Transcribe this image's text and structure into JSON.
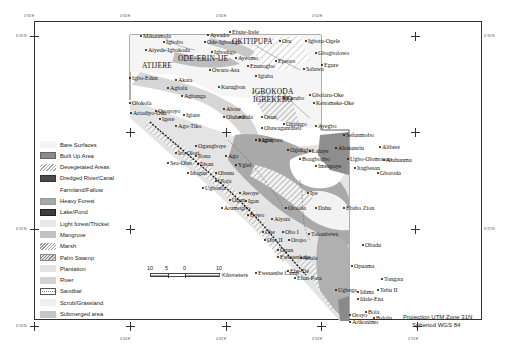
{
  "map": {
    "top_ticks": [
      {
        "x": 34,
        "label": "4°35'E"
      },
      {
        "x": 130,
        "label": "4°40'E"
      },
      {
        "x": 226,
        "label": "4°45'E"
      },
      {
        "x": 321,
        "label": "4°50'E"
      }
    ],
    "bottom_ticks": [
      {
        "x": 130,
        "label": "4°40'E"
      },
      {
        "x": 226,
        "label": "4°45'E"
      },
      {
        "x": 321,
        "label": "4°50'E"
      },
      {
        "x": 417,
        "label": "4°55'E"
      }
    ],
    "left_ticks": [
      {
        "y": 36,
        "label": "6°35'N"
      },
      {
        "y": 229,
        "label": "6°25'N"
      },
      {
        "y": 326,
        "label": "6°20'N"
      }
    ],
    "right_ticks": [
      {
        "y": 36,
        "label": "6°35'N"
      },
      {
        "y": 229,
        "label": "6°25'N"
      }
    ],
    "places": [
      {
        "name": "Mikunmola",
        "x": 143,
        "y": 33
      },
      {
        "name": "Igbobo",
        "x": 166,
        "y": 39
      },
      {
        "name": "Aiyede-Igbokoda",
        "x": 148,
        "y": 47
      },
      {
        "name": "Ayeadre",
        "x": 210,
        "y": 32
      },
      {
        "name": "Ebute-Irele",
        "x": 232,
        "y": 29
      },
      {
        "name": "Ode-Igbodigo",
        "x": 207,
        "y": 39
      },
      {
        "name": "OKITIPUPA",
        "x": 232,
        "y": 38,
        "big": true
      },
      {
        "name": "Oru",
        "x": 282,
        "y": 38
      },
      {
        "name": "Igbodigo",
        "x": 214,
        "y": 49
      },
      {
        "name": "Ayeomo",
        "x": 238,
        "y": 55
      },
      {
        "name": "Igbotu-Ogele",
        "x": 308,
        "y": 38
      },
      {
        "name": "Gbogbolowo",
        "x": 318,
        "y": 50
      },
      {
        "name": "Epeoro",
        "x": 278,
        "y": 58
      },
      {
        "name": "Egure",
        "x": 324,
        "y": 62
      },
      {
        "name": "Enunogbo",
        "x": 250,
        "y": 63
      },
      {
        "name": "Saluwa",
        "x": 306,
        "y": 66
      },
      {
        "name": "ATIJERE",
        "x": 142,
        "y": 62,
        "big": true
      },
      {
        "name": "ODE-ERIN-IJE",
        "x": 178,
        "y": 55,
        "big": true
      },
      {
        "name": "Igbo-Edun",
        "x": 132,
        "y": 75
      },
      {
        "name": "Akata",
        "x": 178,
        "y": 77
      },
      {
        "name": "Owara-Asa",
        "x": 212,
        "y": 67
      },
      {
        "name": "Igiaba",
        "x": 258,
        "y": 73
      },
      {
        "name": "Agbala",
        "x": 170,
        "y": 85
      },
      {
        "name": "Kurugbon",
        "x": 221,
        "y": 84
      },
      {
        "name": "IGBOKODA",
        "x": 252,
        "y": 88,
        "big": true
      },
      {
        "name": "IGBEKEBO",
        "x": 253,
        "y": 96,
        "big": true
      },
      {
        "name": "Agbanga",
        "x": 184,
        "y": 93
      },
      {
        "name": "Gbolaru-Oke",
        "x": 312,
        "y": 92
      },
      {
        "name": "Kurubo",
        "x": 286,
        "y": 95
      },
      {
        "name": "Kenomeke-Oke",
        "x": 316,
        "y": 100
      },
      {
        "name": "Olokola",
        "x": 132,
        "y": 100
      },
      {
        "name": "Abote",
        "x": 226,
        "y": 106
      },
      {
        "name": "Ariadiyo-Oda",
        "x": 133,
        "y": 110
      },
      {
        "name": "Opopoyo",
        "x": 158,
        "y": 108
      },
      {
        "name": "Igiare",
        "x": 186,
        "y": 112
      },
      {
        "name": "Osun",
        "x": 264,
        "y": 114
      },
      {
        "name": "Ilula",
        "x": 242,
        "y": 114
      },
      {
        "name": "Oluhere",
        "x": 226,
        "y": 114
      },
      {
        "name": "Ogiango",
        "x": 286,
        "y": 121
      },
      {
        "name": "Ayegbo",
        "x": 318,
        "y": 123
      },
      {
        "name": "Oluwaguntafeli",
        "x": 264,
        "y": 125
      },
      {
        "name": "Igere",
        "x": 162,
        "y": 116
      },
      {
        "name": "Ago-Tiko",
        "x": 178,
        "y": 123
      },
      {
        "name": "Igbiyoro",
        "x": 262,
        "y": 137
      },
      {
        "name": "Lagos",
        "x": 258,
        "y": 137
      },
      {
        "name": "Sefunmobo",
        "x": 346,
        "y": 132
      },
      {
        "name": "Abokunrin",
        "x": 338,
        "y": 145
      },
      {
        "name": "Alibere",
        "x": 382,
        "y": 144
      },
      {
        "name": "Ugbo-Olomotoro",
        "x": 350,
        "y": 156
      },
      {
        "name": "Aiuhunmu",
        "x": 386,
        "y": 157
      },
      {
        "name": "Itagbesan",
        "x": 357,
        "y": 165
      },
      {
        "name": "Gboroda",
        "x": 380,
        "y": 170
      },
      {
        "name": "Ogungboye",
        "x": 198,
        "y": 143
      },
      {
        "name": "Ito-Olori",
        "x": 178,
        "y": 150
      },
      {
        "name": "Ilona",
        "x": 198,
        "y": 153
      },
      {
        "name": "Ago",
        "x": 228,
        "y": 153
      },
      {
        "name": "Ogidigbo",
        "x": 290,
        "y": 147
      },
      {
        "name": "Lalaye",
        "x": 312,
        "y": 148
      },
      {
        "name": "Boagbogbo",
        "x": 302,
        "y": 156
      },
      {
        "name": "Imeapaye",
        "x": 318,
        "y": 163
      },
      {
        "name": "Sea-Olee",
        "x": 170,
        "y": 160
      },
      {
        "name": "Ilisan",
        "x": 200,
        "y": 161
      },
      {
        "name": "Yglei",
        "x": 238,
        "y": 162
      },
      {
        "name": "Idogun",
        "x": 190,
        "y": 170
      },
      {
        "name": "Obenu",
        "x": 218,
        "y": 170
      },
      {
        "name": "Ugbonla",
        "x": 205,
        "y": 185
      },
      {
        "name": "Oloja",
        "x": 218,
        "y": 178
      },
      {
        "name": "Awoye",
        "x": 242,
        "y": 190
      },
      {
        "name": "Ipe",
        "x": 310,
        "y": 190
      },
      {
        "name": "Ogun",
        "x": 232,
        "y": 197
      },
      {
        "name": "Arumogbo",
        "x": 224,
        "y": 205
      },
      {
        "name": "Igan",
        "x": 248,
        "y": 198
      },
      {
        "name": "Orooba",
        "x": 288,
        "y": 205
      },
      {
        "name": "Dahu",
        "x": 318,
        "y": 205
      },
      {
        "name": "Ebabo Zion",
        "x": 346,
        "y": 205
      },
      {
        "name": "Bowo",
        "x": 250,
        "y": 212
      },
      {
        "name": "Aiyata",
        "x": 274,
        "y": 216
      },
      {
        "name": "Obe",
        "x": 265,
        "y": 229
      },
      {
        "name": "Obo I",
        "x": 285,
        "y": 229
      },
      {
        "name": "Takanbewa",
        "x": 311,
        "y": 231
      },
      {
        "name": "Obo II",
        "x": 267,
        "y": 237
      },
      {
        "name": "Oropo",
        "x": 291,
        "y": 237
      },
      {
        "name": "Obadu",
        "x": 365,
        "y": 242
      },
      {
        "name": "Ogun",
        "x": 280,
        "y": 247
      },
      {
        "name": "Eweuenbeke",
        "x": 280,
        "y": 254
      },
      {
        "name": "Abule",
        "x": 303,
        "y": 255
      },
      {
        "name": "Opuama",
        "x": 354,
        "y": 263
      },
      {
        "name": "Eweuenbe Camp",
        "x": 258,
        "y": 270
      },
      {
        "name": "Ebe-Tie",
        "x": 290,
        "y": 268
      },
      {
        "name": "Efun-Pora",
        "x": 297,
        "y": 275
      },
      {
        "name": "Tongata",
        "x": 384,
        "y": 276
      },
      {
        "name": "Ugbega",
        "x": 338,
        "y": 287
      },
      {
        "name": "Idima",
        "x": 360,
        "y": 289
      },
      {
        "name": "Tebu II",
        "x": 380,
        "y": 287
      },
      {
        "name": "Idale-Ena",
        "x": 360,
        "y": 296
      },
      {
        "name": "Bola",
        "x": 368,
        "y": 309
      },
      {
        "name": "Oroyo",
        "x": 352,
        "y": 312
      },
      {
        "name": "Balolu",
        "x": 376,
        "y": 315
      },
      {
        "name": "Arikonimo",
        "x": 352,
        "y": 319
      }
    ]
  },
  "legend": {
    "items": [
      {
        "label": "Bare Surfaces",
        "fill": "#f4f4f4",
        "pattern": "none",
        "border": "none"
      },
      {
        "label": "Built Up Area",
        "fill": "#8c8c8c",
        "pattern": "none",
        "border": "#666"
      },
      {
        "label": "Devegetated Areas",
        "fill": "#ffffff",
        "pattern": "hatch-light",
        "border": "none"
      },
      {
        "label": "Dredged River/Canal",
        "fill": "#4a4a4a",
        "pattern": "none",
        "border": "#333"
      },
      {
        "label": "Farmland/Fallow",
        "fill": "#ffffff",
        "pattern": "none",
        "border": "none"
      },
      {
        "label": "Heavy Forest",
        "fill": "#a8a8a8",
        "pattern": "none",
        "border": "#999"
      },
      {
        "label": "Lake/Pond",
        "fill": "#3c3c3c",
        "pattern": "none",
        "border": "#222"
      },
      {
        "label": "Light forest/Thicket",
        "fill": "#e8e8e8",
        "pattern": "none",
        "border": "none"
      },
      {
        "label": "Mangrove",
        "fill": "#c2c2c2",
        "pattern": "none",
        "border": "none"
      },
      {
        "label": "Marsh",
        "fill": "#ffffff",
        "pattern": "hatch-dense",
        "border": "none"
      },
      {
        "label": "Palm Swamp",
        "fill": "#d8d8d8",
        "pattern": "hatch-box",
        "border": "#888"
      },
      {
        "label": "Plantation",
        "fill": "#e2e2e2",
        "pattern": "none",
        "border": "none"
      },
      {
        "label": "River",
        "fill": "#d2d2d2",
        "pattern": "none",
        "border": "none"
      },
      {
        "label": "Sandbar",
        "fill": "#ffffff",
        "pattern": "dots",
        "border": "#555"
      },
      {
        "label": "Scrub/Grassland",
        "fill": "#efefef",
        "pattern": "none",
        "border": "none"
      },
      {
        "label": "Submerged area",
        "fill": "#c6c6c6",
        "pattern": "none",
        "border": "none"
      }
    ]
  },
  "scale_bar": {
    "labels": [
      "10",
      "5",
      "0",
      "10"
    ],
    "unit": "Kilometers"
  },
  "projection": {
    "line1": "Projection  UTM Zone 31N",
    "line2": "Spheriod  WGS 84"
  }
}
